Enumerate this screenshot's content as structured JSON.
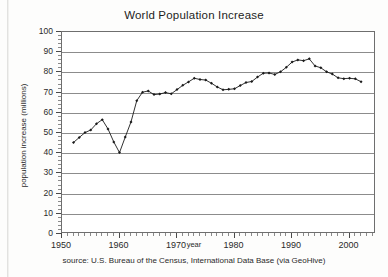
{
  "chart_data": {
    "type": "line",
    "title": "World Population Increase",
    "xlabel": "year",
    "ylabel": "population increase (millions)",
    "caption": "source: U.S. Bureau of the Census, International Data Base (via GeoHive)",
    "xlim": [
      1950,
      2004.6
    ],
    "ylim": [
      0,
      100
    ],
    "grid": true,
    "legend": "none",
    "marker": "filled-diamond",
    "line_color": "#1a1a1a",
    "grid_color": "#8c8c8c",
    "frame_color": "#6e6e6e",
    "xticks_major": [
      1950,
      1960,
      1970,
      1980,
      1990,
      2000
    ],
    "xtick_labels": [
      "1950",
      "1960",
      "1970",
      "1980",
      "1990",
      "2000"
    ],
    "xtick_minor_step": 1,
    "yticks_major": [
      0,
      10,
      20,
      30,
      40,
      50,
      60,
      70,
      80,
      90,
      100
    ],
    "ytick_labels": [
      "0",
      "10",
      "20",
      "30",
      "40",
      "50",
      "60",
      "70",
      "80",
      "90",
      "100"
    ],
    "ytick_minor_step": 2,
    "x": [
      1952,
      1953,
      1954,
      1955,
      1956,
      1957,
      1958,
      1959,
      1960,
      1961,
      1962,
      1963,
      1964,
      1965,
      1966,
      1967,
      1968,
      1969,
      1970,
      1971,
      1972,
      1973,
      1974,
      1975,
      1976,
      1977,
      1978,
      1979,
      1980,
      1981,
      1982,
      1983,
      1984,
      1985,
      1986,
      1987,
      1988,
      1989,
      1990,
      1991,
      1992,
      1993,
      1994,
      1995,
      1996,
      1997,
      1998,
      1999,
      2000,
      2001,
      2002
    ],
    "values": [
      45.3,
      47.8,
      50.2,
      51.5,
      54.6,
      56.6,
      52.0,
      45.6,
      40.3,
      48.0,
      55.5,
      66.0,
      70.2,
      70.8,
      69.0,
      69.3,
      70.0,
      69.4,
      71.5,
      73.6,
      75.3,
      77.1,
      76.5,
      76.2,
      74.6,
      72.8,
      71.4,
      71.6,
      71.9,
      73.5,
      75.0,
      75.5,
      77.7,
      79.6,
      79.7,
      79.0,
      80.3,
      82.5,
      85.1,
      86.2,
      85.8,
      86.7,
      83.2,
      82.3,
      80.3,
      79.2,
      77.3,
      76.9,
      77.1,
      76.8,
      75.4
    ],
    "series_name": "world population increase"
  }
}
